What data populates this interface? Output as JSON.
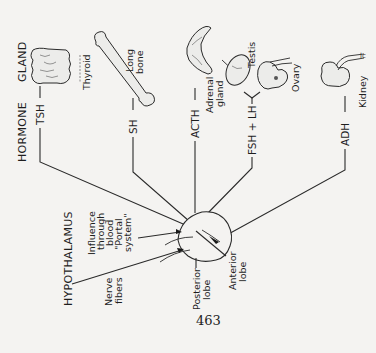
{
  "diagram": {
    "headers": {
      "hormone": "HORMONE",
      "gland": "GLAND"
    },
    "hormones": [
      {
        "label": "TSH",
        "target": "Thyroid"
      },
      {
        "label": "SH",
        "target": "Long bone"
      },
      {
        "label": "ACTH",
        "target": "Adrenal gland"
      },
      {
        "label": "FSH + LH",
        "target": "Testis / Ovary"
      },
      {
        "label": "ADH",
        "target": "Kidney"
      }
    ],
    "glands": {
      "thyroid": "Thyroid",
      "long_bone_1": "Long",
      "long_bone_2": "bone",
      "adrenal_1": "Adrenal",
      "adrenal_2": "gland",
      "testis": "Testis",
      "ovary": "Ovary",
      "kidney": "Kidney"
    },
    "source": {
      "hypothalamus": "HYPOTHALAMUS",
      "influence_1": "Influence",
      "influence_2": "through",
      "influence_3": "blood",
      "influence_4": "\"Portal",
      "influence_5": "system\"",
      "nerve_1": "Nerve",
      "nerve_2": "fibers"
    },
    "pituitary": {
      "posterior_1": "Posterior",
      "posterior_2": "lobe",
      "anterior_1": "Anterior",
      "anterior_2": "lobe"
    },
    "page_number": "463",
    "orientation": "rotated 90° counter-clockwise"
  }
}
